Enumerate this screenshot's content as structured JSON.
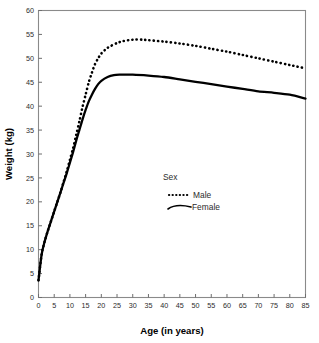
{
  "chart_data": {
    "type": "line",
    "title": "",
    "xlabel": "Age (in years)",
    "ylabel": "Weight (kg)",
    "xlim": [
      0,
      85
    ],
    "ylim": [
      0,
      60
    ],
    "xticks": [
      0,
      5,
      10,
      15,
      20,
      25,
      30,
      35,
      40,
      45,
      50,
      55,
      60,
      65,
      70,
      75,
      80,
      85
    ],
    "yticks": [
      0,
      5,
      10,
      15,
      20,
      25,
      30,
      35,
      40,
      45,
      50,
      55,
      60
    ],
    "xtick_labels": [
      "0",
      "5",
      "10",
      "15",
      "20",
      "25",
      "30",
      "35",
      "40",
      "45",
      "50",
      "55",
      "60",
      "65",
      "70",
      "75",
      "80",
      "85"
    ],
    "ytick_labels": [
      "0",
      "5",
      "10",
      "15",
      "20",
      "25",
      "30",
      "35",
      "40",
      "45",
      "50",
      "55",
      "60"
    ],
    "grid": false,
    "legend_position": "center",
    "legend_title": "Sex",
    "series": [
      {
        "name": "Male",
        "style": "dotted",
        "color": "#000000",
        "x": [
          0,
          1,
          2,
          3,
          4,
          5,
          6,
          7,
          8,
          9,
          10,
          11,
          12,
          13,
          14,
          15,
          16,
          17,
          18,
          19,
          20,
          22,
          25,
          27,
          30,
          33,
          35,
          40,
          45,
          50,
          55,
          60,
          65,
          70,
          75,
          80,
          85
        ],
        "y": [
          3.6,
          9.0,
          11.8,
          14.0,
          16.0,
          18.0,
          20.0,
          22.0,
          24.2,
          26.4,
          28.8,
          31.2,
          34.0,
          36.8,
          39.8,
          42.4,
          45.0,
          47.0,
          48.8,
          50.0,
          51.0,
          52.2,
          53.2,
          53.6,
          53.9,
          53.9,
          53.8,
          53.5,
          53.1,
          52.6,
          52.0,
          51.4,
          50.7,
          50.0,
          49.3,
          48.6,
          47.9
        ]
      },
      {
        "name": "Female",
        "style": "solid",
        "color": "#000000",
        "x": [
          0,
          1,
          2,
          3,
          4,
          5,
          6,
          7,
          8,
          9,
          10,
          11,
          12,
          13,
          14,
          15,
          16,
          17,
          18,
          19,
          20,
          22,
          24,
          26,
          27,
          30,
          35,
          40,
          45,
          50,
          55,
          60,
          65,
          70,
          75,
          80,
          85
        ],
        "y": [
          3.6,
          9.0,
          11.8,
          14.0,
          16.0,
          18.0,
          20.0,
          22.0,
          24.0,
          26.0,
          28.2,
          30.4,
          32.8,
          35.0,
          37.2,
          39.2,
          41.0,
          42.4,
          43.6,
          44.6,
          45.3,
          46.1,
          46.5,
          46.6,
          46.6,
          46.6,
          46.4,
          46.1,
          45.6,
          45.1,
          44.6,
          44.1,
          43.6,
          43.1,
          42.8,
          42.4,
          41.6
        ]
      }
    ],
    "legend_entries": [
      {
        "label": "Male",
        "style": "dotted"
      },
      {
        "label": "Female",
        "style": "solid"
      }
    ]
  }
}
